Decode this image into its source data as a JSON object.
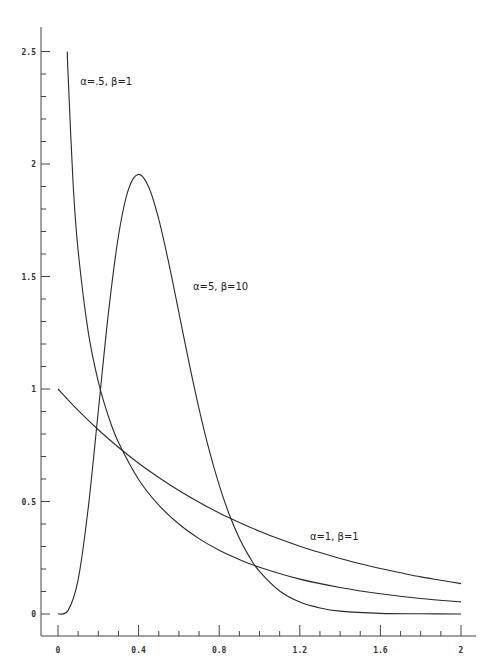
{
  "chart_data": {
    "type": "line",
    "title": "",
    "xlabel": "",
    "ylabel": "",
    "xlim": [
      0,
      2
    ],
    "ylim": [
      0,
      2.5
    ],
    "grid": false,
    "legend": "inline labels",
    "x_ticks": [
      {
        "value": 0,
        "label": "0"
      },
      {
        "value": 0.4,
        "label": "0.4"
      },
      {
        "value": 0.8,
        "label": "0.8"
      },
      {
        "value": 1.2,
        "label": "1.2"
      },
      {
        "value": 1.6,
        "label": "1.6"
      },
      {
        "value": 2,
        "label": "2"
      }
    ],
    "x_minor_step": 0.1,
    "y_ticks": [
      {
        "value": 0,
        "label": "0"
      },
      {
        "value": 0.5,
        "label": "0.5"
      },
      {
        "value": 1,
        "label": "1"
      },
      {
        "value": 1.5,
        "label": "1.5"
      },
      {
        "value": 2,
        "label": "2"
      },
      {
        "value": 2.5,
        "label": "2.5"
      }
    ],
    "y_minor_step": 0.1,
    "series": [
      {
        "name": "α=.5, β=1",
        "label_pos": {
          "x": 0.11,
          "y": 2.35
        },
        "points": [
          [
            0.046,
            2.5
          ],
          [
            0.05,
            2.4
          ],
          [
            0.075,
            1.912
          ],
          [
            0.1,
            1.614
          ],
          [
            0.15,
            1.254
          ],
          [
            0.2,
            1.033
          ],
          [
            0.25,
            0.879
          ],
          [
            0.3,
            0.763
          ],
          [
            0.4,
            0.598
          ],
          [
            0.5,
            0.484
          ],
          [
            0.6,
            0.4
          ],
          [
            0.7,
            0.335
          ],
          [
            0.8,
            0.283
          ],
          [
            0.9,
            0.242
          ],
          [
            1.0,
            0.208
          ],
          [
            1.2,
            0.155
          ],
          [
            1.4,
            0.118
          ],
          [
            1.6,
            0.09
          ],
          [
            1.8,
            0.069
          ],
          [
            2.0,
            0.054
          ]
        ]
      },
      {
        "name": "α=5, β=10",
        "label_pos": {
          "x": 0.67,
          "y": 1.44
        },
        "points": [
          [
            0,
            0
          ],
          [
            0.05,
            0.016
          ],
          [
            0.1,
            0.153
          ],
          [
            0.15,
            0.471
          ],
          [
            0.2,
            0.902
          ],
          [
            0.25,
            1.336
          ],
          [
            0.3,
            1.68
          ],
          [
            0.35,
            1.888
          ],
          [
            0.4,
            1.954
          ],
          [
            0.45,
            1.898
          ],
          [
            0.5,
            1.755
          ],
          [
            0.55,
            1.558
          ],
          [
            0.6,
            1.339
          ],
          [
            0.65,
            1.118
          ],
          [
            0.7,
            0.912
          ],
          [
            0.75,
            0.729
          ],
          [
            0.8,
            0.573
          ],
          [
            0.85,
            0.442
          ],
          [
            0.9,
            0.337
          ],
          [
            0.95,
            0.254
          ],
          [
            1.0,
            0.189
          ],
          [
            1.1,
            0.102
          ],
          [
            1.2,
            0.053
          ],
          [
            1.3,
            0.027
          ],
          [
            1.4,
            0.013
          ],
          [
            1.6,
            0.003
          ],
          [
            1.8,
            0.001
          ],
          [
            2.0,
            0.0001
          ]
        ]
      },
      {
        "name": "α=1, β=1",
        "label_pos": {
          "x": 1.25,
          "y": 0.33
        },
        "points": [
          [
            0,
            1
          ],
          [
            0.1,
            0.905
          ],
          [
            0.2,
            0.819
          ],
          [
            0.3,
            0.741
          ],
          [
            0.4,
            0.67
          ],
          [
            0.5,
            0.607
          ],
          [
            0.6,
            0.549
          ],
          [
            0.7,
            0.497
          ],
          [
            0.8,
            0.449
          ],
          [
            0.9,
            0.407
          ],
          [
            1.0,
            0.368
          ],
          [
            1.1,
            0.333
          ],
          [
            1.2,
            0.301
          ],
          [
            1.3,
            0.273
          ],
          [
            1.4,
            0.247
          ],
          [
            1.5,
            0.223
          ],
          [
            1.6,
            0.202
          ],
          [
            1.7,
            0.183
          ],
          [
            1.8,
            0.165
          ],
          [
            1.9,
            0.15
          ],
          [
            2.0,
            0.135
          ]
        ]
      }
    ]
  }
}
